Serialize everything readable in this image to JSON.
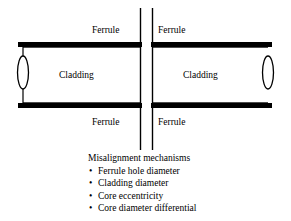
{
  "figure": {
    "type": "technical-line-diagram",
    "background_color": "#ffffff",
    "ink_color": "#000000"
  },
  "labels": {
    "ferrule_top_left": "Ferrule",
    "ferrule_top_right": "Ferrule",
    "ferrule_bottom_left": "Ferrule",
    "ferrule_bottom_right": "Ferrule",
    "cladding_left": "Cladding",
    "cladding_right": "Cladding"
  },
  "caption": {
    "heading": "Misalignment mechanisms",
    "bullet_glyph": "•",
    "items": [
      "Ferrule hole diameter",
      "Cladding diameter",
      "Core eccentricity",
      "Core diameter differential"
    ]
  },
  "geometry": {
    "cylinder": {
      "left_x": 18,
      "right_x": 272,
      "top_bar_y": 42,
      "bottom_bar_y": 103,
      "bar_thickness": 5,
      "end_cap_ellipse_rx": 5,
      "end_cap_ellipse_ry": 16
    },
    "joint": {
      "left_line_x": 140,
      "right_line_x": 152,
      "line_top_y": 8,
      "line_bottom_y": 150,
      "line_width": 1.4
    }
  }
}
